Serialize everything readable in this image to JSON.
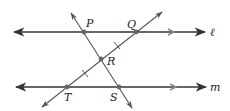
{
  "diagram": {
    "type": "geometry",
    "lines": {
      "l": {
        "label": "ℓ",
        "y": 32,
        "x1": 14,
        "x2": 205,
        "parallel_marker": true
      },
      "m": {
        "label": "m",
        "y": 87,
        "x1": 16,
        "x2": 206,
        "parallel_marker": true
      }
    },
    "transversals": [
      {
        "name": "PS",
        "x1": 71,
        "y1": 13,
        "x2": 132,
        "y2": 108
      },
      {
        "name": "QT",
        "x1": 162,
        "y1": 12,
        "x2": 42,
        "y2": 107
      }
    ],
    "points": {
      "P": {
        "label": "P",
        "x": 84,
        "y": 32
      },
      "Q": {
        "label": "Q",
        "x": 136,
        "y": 32
      },
      "R": {
        "label": "R",
        "x": 101,
        "y": 59
      },
      "T": {
        "label": "T",
        "x": 67,
        "y": 87
      },
      "S": {
        "label": "S",
        "x": 119,
        "y": 87
      }
    },
    "congruence_marks": [
      "QR",
      "RT"
    ],
    "colors": {
      "line": "#333333",
      "transversal": "#555555",
      "point": "#666666",
      "label": "#222222"
    }
  }
}
